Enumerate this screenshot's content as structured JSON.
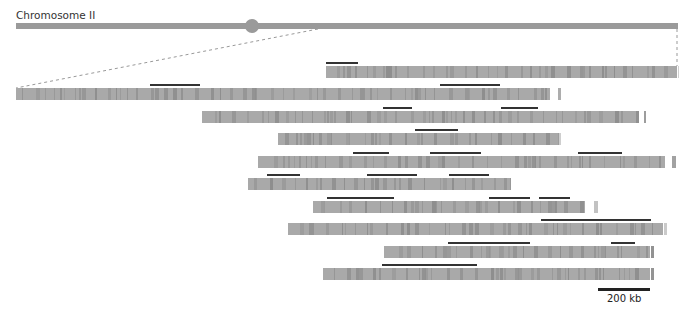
{
  "title": "Chromosome II",
  "scale_bar": {
    "label": "200 kb"
  },
  "colors": {
    "bar": "#a9a9a9",
    "band": "#8e8e8e",
    "highlight": "#333333",
    "chromosome": "#9a9a9a"
  },
  "rows": [
    {
      "left": 326,
      "right": 677,
      "top": 66,
      "highlights": [
        [
          326,
          358
        ]
      ]
    },
    {
      "left": 16,
      "right": 550,
      "top": 88,
      "highlights": [
        [
          150,
          200
        ],
        [
          440,
          500
        ]
      ]
    },
    {
      "left": 202,
      "right": 639,
      "top": 111,
      "highlights": [
        [
          383,
          412
        ],
        [
          501,
          538
        ]
      ]
    },
    {
      "left": 278,
      "right": 559,
      "top": 133,
      "highlights": [
        [
          415,
          458
        ]
      ]
    },
    {
      "left": 258,
      "right": 665,
      "top": 156,
      "highlights": [
        [
          353,
          389
        ],
        [
          430,
          481
        ],
        [
          578,
          622
        ]
      ]
    },
    {
      "left": 248,
      "right": 511,
      "top": 178,
      "highlights": [
        [
          267,
          300
        ],
        [
          367,
          417
        ],
        [
          449,
          489
        ]
      ]
    },
    {
      "left": 313,
      "right": 585,
      "top": 201,
      "highlights": [
        [
          327,
          394
        ],
        [
          489,
          530
        ],
        [
          539,
          570
        ]
      ]
    },
    {
      "left": 288,
      "right": 663,
      "top": 223,
      "highlights": [
        [
          541,
          651
        ]
      ]
    },
    {
      "left": 384,
      "right": 650,
      "top": 246,
      "highlights": [
        [
          448,
          530
        ],
        [
          611,
          635
        ]
      ]
    },
    {
      "left": 323,
      "right": 650,
      "top": 268,
      "highlights": [
        [
          382,
          477
        ]
      ]
    }
  ]
}
